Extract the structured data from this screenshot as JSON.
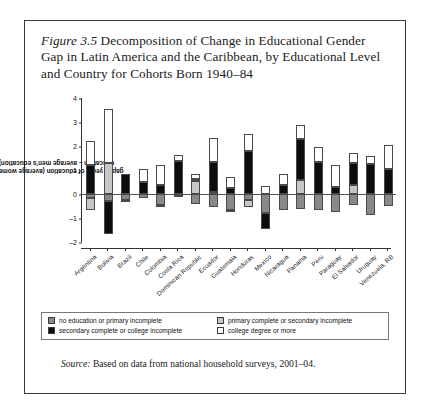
{
  "figure": {
    "number_label": "Figure 3.5",
    "caption": " Decomposition of Change in Educational Gender Gap in Latin America and the Caribbean, by Educational Level and Country for Cohorts Born 1940–84",
    "source_label": "Source:",
    "source_text": " Based on data from national household surveys, 2001–04."
  },
  "legend": {
    "items": [
      {
        "key": "k0",
        "label": "no education or primary incomplete",
        "color": "#898989"
      },
      {
        "key": "k1",
        "label": "primary complete or secondary incomplete",
        "color": "#c6c6c6"
      },
      {
        "key": "k2",
        "label": "secondary complete or college incomplete",
        "color": "#0d0d0d"
      },
      {
        "key": "k3",
        "label": "college degree or more",
        "color": "#ffffff"
      }
    ],
    "order": [
      0,
      1,
      2,
      3
    ]
  },
  "chart_data": {
    "type": "bar",
    "title": "Decomposition of Change in Educational Gender Gap in Latin America and the Caribbean, by Educational Level and Country for Cohorts Born 1940–84",
    "subtitle": "",
    "xlabel": "",
    "ylabel": "gap in years of education (average women's education – average men's education)",
    "ylim": [
      -2,
      4
    ],
    "yticks": [
      -2,
      -1,
      0,
      1,
      2,
      3,
      4
    ],
    "ytick_labels": [
      "–2",
      "–1",
      "0",
      "1",
      "2",
      "3",
      "4"
    ],
    "grid": false,
    "stacked": true,
    "legend_position": "bottom",
    "categories": [
      "Argentina",
      "Bolivia",
      "Brazil",
      "Chile",
      "Colombia",
      "Costa Rica",
      "Dominican Republic",
      "Ecuador",
      "Guatemala",
      "Honduras",
      "Mexico",
      "Nicaragua",
      "Panama",
      "Peru",
      "Paraguay",
      "El Salvador",
      "Uruguay",
      "Venezuela, RB"
    ],
    "series": [
      {
        "name": "no education or primary incomplete",
        "color": "#898989",
        "values": [
          -0.15,
          -0.3,
          -0.25,
          -0.15,
          -0.45,
          -0.05,
          -0.4,
          -0.55,
          -0.65,
          -0.25,
          -0.8,
          -0.65,
          -0.6,
          -0.65,
          -0.75,
          -0.45,
          -0.85,
          -0.5
        ]
      },
      {
        "name": "primary complete or secondary incomplete",
        "color": "#c6c6c6",
        "values": [
          -0.5,
          1.3,
          -0.05,
          0.0,
          -0.1,
          -0.05,
          0.55,
          0.1,
          -0.1,
          -0.3,
          0.0,
          0.0,
          0.6,
          0.0,
          0.0,
          0.4,
          0.0,
          0.0
        ]
      },
      {
        "name": "secondary complete or college incomplete",
        "color": "#0d0d0d",
        "values": [
          1.2,
          -1.35,
          0.85,
          0.5,
          0.4,
          1.4,
          0.1,
          1.25,
          0.25,
          1.8,
          -0.65,
          0.4,
          1.7,
          1.35,
          0.3,
          0.9,
          1.25,
          1.05
        ]
      },
      {
        "name": "college degree or more",
        "color": "#ffffff",
        "values": [
          1.0,
          2.25,
          0.0,
          0.55,
          0.8,
          0.25,
          0.2,
          1.0,
          0.45,
          0.7,
          0.35,
          0.45,
          0.6,
          0.6,
          0.9,
          0.4,
          0.35,
          1.0
        ]
      }
    ]
  }
}
